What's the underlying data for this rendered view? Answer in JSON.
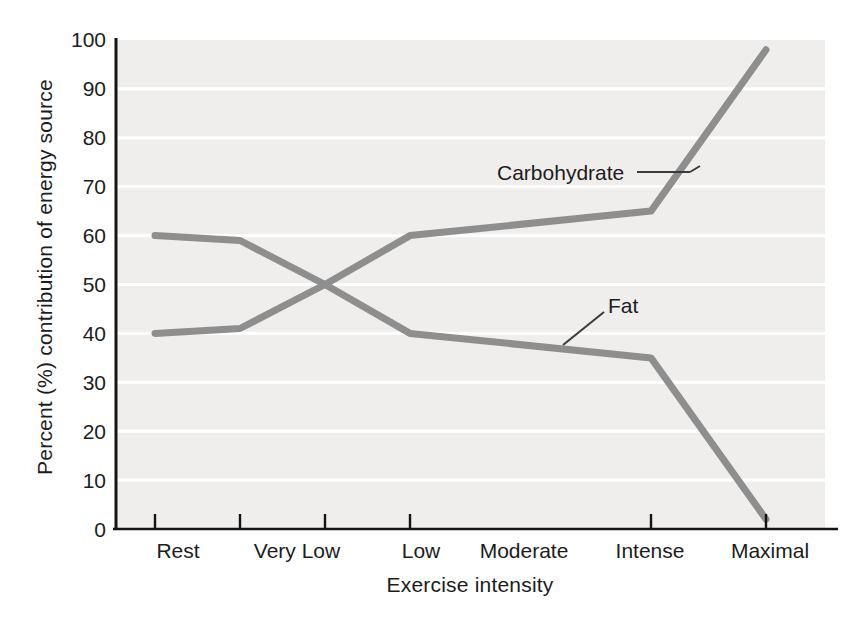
{
  "chart_data": {
    "type": "line",
    "title": "",
    "xlabel": "Exercise intensity",
    "ylabel": "Percent (%) contribution of energy source",
    "categories": [
      "Rest",
      "Very Low",
      "Low",
      "Moderate",
      "Intense",
      "Maximal"
    ],
    "series": [
      {
        "name": "Carbohydrate",
        "values": [
          40,
          41,
          50,
          60,
          65,
          98
        ],
        "color": "#8e8e8e"
      },
      {
        "name": "Fat",
        "values": [
          60,
          59,
          50,
          40,
          35,
          2
        ],
        "color": "#8e8e8e"
      }
    ],
    "ylim": [
      0,
      100
    ],
    "yticks": [
      "0",
      "10",
      "20",
      "30",
      "40",
      "50",
      "60",
      "70",
      "80",
      "90",
      "100"
    ],
    "grid": true,
    "grid_color": "#ffffff",
    "plot_background": "#efeeec",
    "axis_color": "#141414",
    "legend": "none",
    "annotations": [
      {
        "label": "Carbohydrate",
        "attached_to": "Carbohydrate",
        "leader": true
      },
      {
        "label": "Fat",
        "attached_to": "Fat",
        "leader": true
      }
    ]
  },
  "axis": {
    "y_title": "Percent (%) contribution of energy source",
    "x_title": "Exercise intensity",
    "y_ticks": [
      {
        "value": "100"
      },
      {
        "value": "90"
      },
      {
        "value": "80"
      },
      {
        "value": "70"
      },
      {
        "value": "60"
      },
      {
        "value": "50"
      },
      {
        "value": "40"
      },
      {
        "value": "30"
      },
      {
        "value": "20"
      },
      {
        "value": "10"
      },
      {
        "value": "0"
      }
    ],
    "x_ticks": [
      {
        "value": "Rest"
      },
      {
        "value": "Very Low"
      },
      {
        "value": "Low"
      },
      {
        "value": "Moderate"
      },
      {
        "value": "Intense"
      },
      {
        "value": "Maximal"
      }
    ]
  },
  "labels": {
    "carbohydrate": "Carbohydrate",
    "fat": "Fat"
  }
}
